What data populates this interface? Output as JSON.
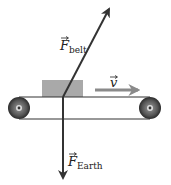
{
  "diagram": {
    "type": "free-body diagram",
    "colors": {
      "arrow": "#333333",
      "velocity_arrow": "#8a8a8a",
      "box": "#a9a9a9",
      "roller": "#555555",
      "belt": "#333333"
    },
    "forces": [
      {
        "symbol": "F",
        "subscript": "belt",
        "direction": "up-right"
      },
      {
        "symbol": "F",
        "subscript": "Earth",
        "direction": "down"
      }
    ],
    "velocity": {
      "symbol": "v",
      "direction": "right"
    }
  },
  "labels": {
    "f_belt_symbol": "F",
    "f_belt_sub": "belt",
    "f_earth_symbol": "F",
    "f_earth_sub": "Earth",
    "v_symbol": "v"
  }
}
